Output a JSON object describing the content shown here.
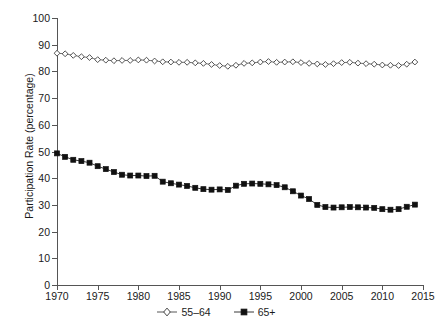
{
  "chart_data": {
    "type": "line",
    "title": "",
    "subtitle": "",
    "xlabel": "",
    "ylabel": "Participation Rate (percentage)",
    "xlim": [
      1970,
      2015
    ],
    "ylim": [
      0,
      100
    ],
    "grid": false,
    "legend_position": "bottom-center",
    "y_ticks": [
      0,
      10,
      20,
      30,
      40,
      50,
      60,
      70,
      80,
      90,
      100
    ],
    "x_ticks": [
      1970,
      1975,
      1980,
      1985,
      1990,
      1995,
      2000,
      2005,
      2010,
      2015
    ],
    "x": [
      1970,
      1971,
      1972,
      1973,
      1974,
      1975,
      1976,
      1977,
      1978,
      1979,
      1980,
      1981,
      1982,
      1983,
      1984,
      1985,
      1986,
      1987,
      1988,
      1989,
      1990,
      1991,
      1992,
      1993,
      1994,
      1995,
      1996,
      1997,
      1998,
      1999,
      2000,
      2001,
      2002,
      2003,
      2004,
      2005,
      2006,
      2007,
      2008,
      2009,
      2010,
      2011,
      2012,
      2013,
      2014
    ],
    "series": [
      {
        "name": "55–64",
        "marker": "open-diamond",
        "color": "#333333",
        "values": [
          86.8,
          86.6,
          86.0,
          85.5,
          85.2,
          84.4,
          84.2,
          84.0,
          84.1,
          84.1,
          84.3,
          84.2,
          83.9,
          83.6,
          83.5,
          83.4,
          83.4,
          83.2,
          83.0,
          82.6,
          82.2,
          81.9,
          82.3,
          83.0,
          83.2,
          83.5,
          83.7,
          83.4,
          83.5,
          83.6,
          83.3,
          83.0,
          82.8,
          82.6,
          82.9,
          83.3,
          83.4,
          83.1,
          82.9,
          82.7,
          82.4,
          82.3,
          82.2,
          82.7,
          83.5
        ]
      },
      {
        "name": "65+",
        "marker": "filled-square",
        "color": "#111111",
        "values": [
          49.3,
          48.0,
          46.9,
          46.4,
          45.8,
          44.5,
          43.4,
          42.3,
          41.3,
          41.0,
          41.0,
          40.8,
          40.9,
          38.7,
          38.1,
          37.6,
          37.1,
          36.4,
          35.9,
          35.7,
          35.8,
          35.6,
          37.2,
          37.9,
          38.0,
          37.9,
          37.7,
          37.4,
          36.6,
          35.1,
          33.5,
          32.2,
          30.0,
          29.2,
          29.0,
          29.1,
          29.2,
          29.1,
          29.0,
          28.9,
          28.4,
          28.2,
          28.4,
          29.3,
          30.1
        ]
      }
    ]
  },
  "legend": {
    "items": [
      {
        "label": "55–64",
        "marker": "open-diamond"
      },
      {
        "label": "65+",
        "marker": "filled-square"
      }
    ]
  }
}
